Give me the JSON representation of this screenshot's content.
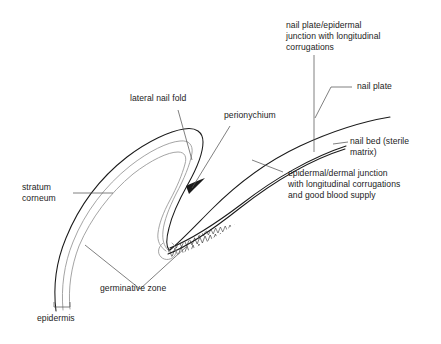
{
  "figure": {
    "kind": "anatomical-line-diagram",
    "ink_color": "#1a1a1a",
    "soft_color": "#9a9a9a",
    "background": "#ffffff"
  },
  "labels": {
    "nail_plate_epidermal_junction": "nail plate/epidermal\njunction with longitudinal\ncorrugations",
    "nail_plate": "nail plate",
    "nail_bed": "nail bed (sterile\nmatrix)",
    "epidermal_dermal_junction": "epidermal/dermal junction\nwith longitudinal corrugations\nand good blood supply",
    "lateral_nail_fold": "lateral nail fold",
    "perionychium": "perionychium",
    "stratum_corneum": "stratum\ncorneum",
    "germinative_zone": "germinative zone",
    "epidermis": "epidermis"
  }
}
